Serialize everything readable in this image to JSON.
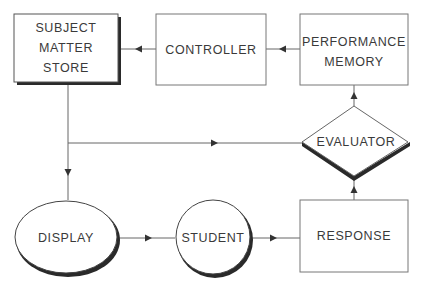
{
  "diagram": {
    "type": "flowchart",
    "nodes": [
      {
        "id": "subject_matter_store",
        "label": "SUBJECT\nMATTER\nSTORE",
        "shape": "rectangle-shadowed"
      },
      {
        "id": "controller",
        "label": "CONTROLLER",
        "shape": "rectangle"
      },
      {
        "id": "performance_memory",
        "label": "PERFORMANCE\nMEMORY",
        "shape": "rectangle"
      },
      {
        "id": "evaluator",
        "label": "EVALUATOR",
        "shape": "diamond-shadowed"
      },
      {
        "id": "display",
        "label": "DISPLAY",
        "shape": "ellipse-shadowed"
      },
      {
        "id": "student",
        "label": "STUDENT",
        "shape": "circle-shadowed"
      },
      {
        "id": "response",
        "label": "RESPONSE",
        "shape": "rectangle"
      }
    ],
    "edges": [
      {
        "from": "controller",
        "to": "subject_matter_store"
      },
      {
        "from": "performance_memory",
        "to": "controller"
      },
      {
        "from": "evaluator",
        "to": "performance_memory"
      },
      {
        "from": "subject_matter_store",
        "to": "display"
      },
      {
        "from": "subject_matter_store",
        "to": "evaluator"
      },
      {
        "from": "display",
        "to": "student"
      },
      {
        "from": "student",
        "to": "response"
      },
      {
        "from": "response",
        "to": "evaluator"
      }
    ]
  },
  "colors": {
    "line": "#555555",
    "shadow": "#2a2a2a",
    "text": "#3a3a3a",
    "background": "#ffffff"
  }
}
